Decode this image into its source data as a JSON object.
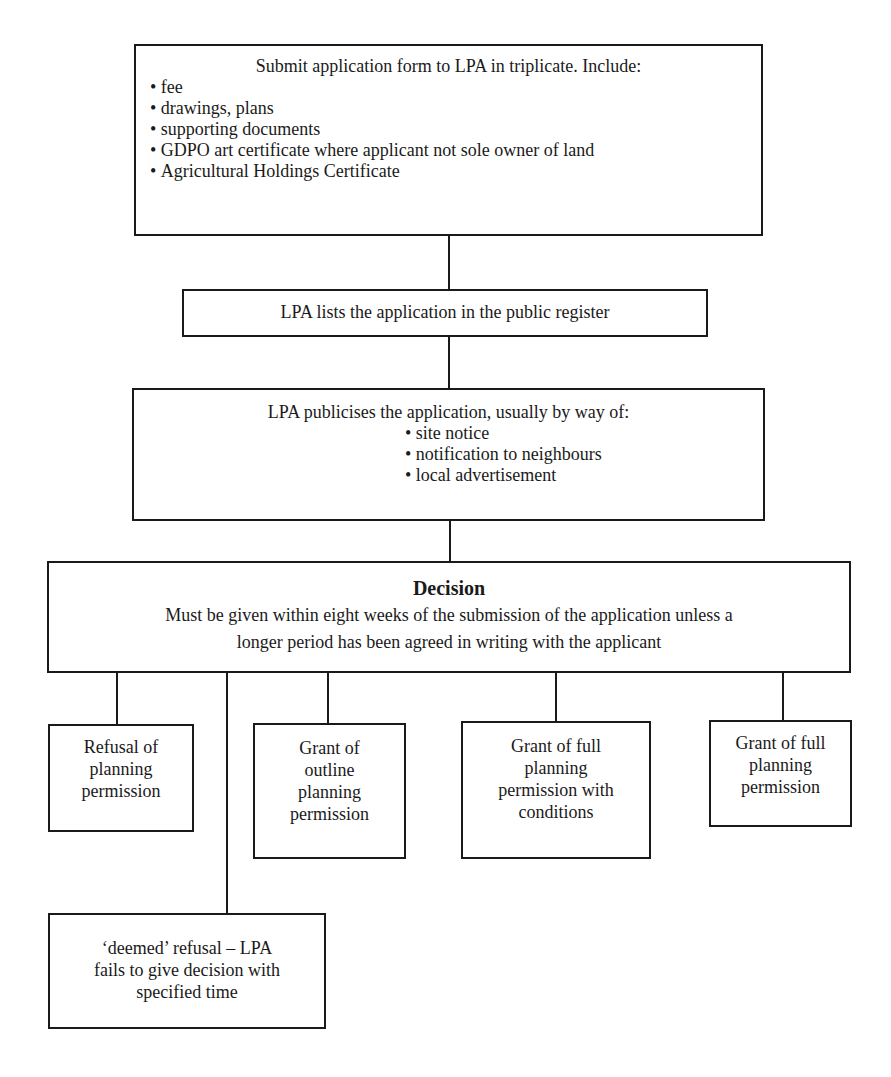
{
  "diagram": {
    "step1": {
      "title": "Submit application form to LPA in triplicate. Include:",
      "items": [
        "fee",
        "drawings, plans",
        "supporting documents",
        "GDPO art certificate where applicant not sole owner of land",
        "Agricultural Holdings Certificate"
      ]
    },
    "step2": {
      "title": "LPA lists the application in the public register"
    },
    "step3": {
      "title": "LPA publicises the application, usually by way of:",
      "items": [
        "site notice",
        "notification to neighbours",
        "local advertisement"
      ]
    },
    "decision": {
      "heading": "Decision",
      "line1": "Must be given within eight weeks of the submission of the application unless a",
      "line2": "longer period has been agreed in writing with the applicant"
    },
    "outcomes": [
      {
        "lines": [
          "Refusal of",
          "planning",
          "permission"
        ]
      },
      {
        "lines": [
          "Grant of",
          "outline",
          "planning",
          "permission"
        ]
      },
      {
        "lines": [
          "Grant of full",
          "planning",
          "permission with",
          "conditions"
        ]
      },
      {
        "lines": [
          "Grant of full",
          "planning",
          "permission"
        ]
      }
    ],
    "deemed": {
      "lines": [
        "‘deemed’ refusal – LPA",
        "fails to give decision with",
        "specified time"
      ]
    }
  }
}
